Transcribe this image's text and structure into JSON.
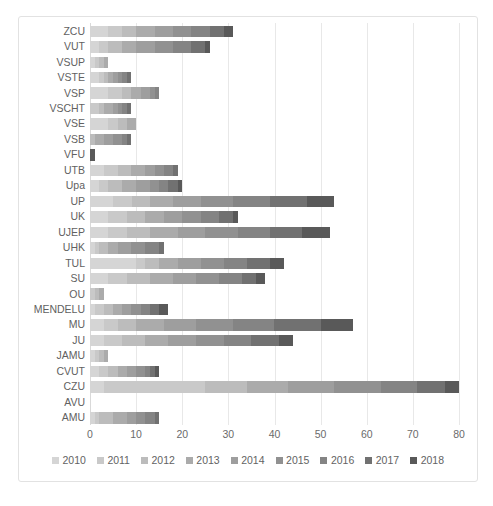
{
  "caption": "",
  "axis": {
    "xticks": [
      0,
      10,
      20,
      30,
      40,
      50,
      60,
      70,
      80
    ],
    "xmin": 0,
    "xmax": 80
  },
  "chart_data": {
    "type": "bar",
    "orientation": "horizontal",
    "stacked": true,
    "title": "",
    "xlabel": "",
    "ylabel": "",
    "xlim": [
      0,
      80
    ],
    "grid": true,
    "legend_position": "bottom",
    "categories": [
      "ZCU",
      "VUT",
      "VSUP",
      "VSTE",
      "VSP",
      "VSCHT",
      "VSE",
      "VSB",
      "VFU",
      "UTB",
      "Upa",
      "UP",
      "UK",
      "UJEP",
      "UHK",
      "TUL",
      "SU",
      "OU",
      "MENDELU",
      "MU",
      "JU",
      "JAMU",
      "CVUT",
      "CZU",
      "AVU",
      "AMU"
    ],
    "series": [
      {
        "name": "2010",
        "color": "#d5d5d5",
        "values": [
          4,
          2,
          1,
          2,
          4,
          0,
          4,
          0,
          0,
          3,
          2,
          5,
          4,
          4,
          1,
          10,
          4,
          0,
          1,
          3,
          3,
          1,
          2,
          3,
          0,
          1
        ]
      },
      {
        "name": "2011",
        "color": "#c9c9c9",
        "values": [
          3,
          2,
          1,
          1,
          3,
          2,
          2,
          0,
          0,
          3,
          2,
          4,
          4,
          4,
          1,
          2,
          4,
          1,
          2,
          3,
          4,
          1,
          2,
          22,
          0,
          1
        ]
      },
      {
        "name": "2012",
        "color": "#bcbcbc",
        "values": [
          3,
          3,
          1,
          1,
          2,
          1,
          2,
          1,
          0,
          3,
          3,
          4,
          4,
          5,
          2,
          3,
          5,
          1,
          2,
          4,
          5,
          1,
          2,
          9,
          0,
          3
        ]
      },
      {
        "name": "2013",
        "color": "#ababab",
        "values": [
          4,
          3,
          1,
          1,
          2,
          2,
          2,
          2,
          0,
          3,
          3,
          5,
          4,
          6,
          2,
          4,
          5,
          1,
          2,
          6,
          5,
          1,
          2,
          9,
          0,
          3
        ]
      },
      {
        "name": "2014",
        "color": "#9e9e9e",
        "values": [
          4,
          4,
          0,
          1,
          2,
          1,
          0,
          2,
          0,
          2,
          3,
          6,
          4,
          6,
          3,
          5,
          5,
          0,
          2,
          7,
          6,
          0,
          2,
          10,
          0,
          2
        ]
      },
      {
        "name": "2015",
        "color": "#919191",
        "values": [
          4,
          4,
          0,
          1,
          1,
          1,
          0,
          2,
          0,
          2,
          2,
          7,
          4,
          7,
          3,
          5,
          5,
          0,
          2,
          8,
          6,
          0,
          2,
          10,
          0,
          2
        ]
      },
      {
        "name": "2016",
        "color": "#848484",
        "values": [
          4,
          4,
          0,
          1,
          1,
          1,
          0,
          1,
          0,
          2,
          2,
          8,
          4,
          7,
          3,
          5,
          5,
          0,
          2,
          9,
          6,
          0,
          1,
          8,
          0,
          2
        ]
      },
      {
        "name": "2017",
        "color": "#717171",
        "values": [
          3,
          3,
          0,
          1,
          0,
          1,
          0,
          1,
          0,
          1,
          2,
          8,
          3,
          7,
          1,
          5,
          3,
          0,
          2,
          10,
          6,
          0,
          1,
          6,
          0,
          1
        ]
      },
      {
        "name": "2018",
        "color": "#595959",
        "values": [
          2,
          1,
          0,
          0,
          0,
          0,
          0,
          0,
          1,
          0,
          1,
          6,
          1,
          6,
          0,
          3,
          2,
          0,
          2,
          7,
          3,
          0,
          1,
          3,
          0,
          0
        ]
      }
    ],
    "totals": [
      31,
      26,
      4,
      9,
      15,
      9,
      10,
      9,
      1,
      19,
      20,
      53,
      32,
      52,
      16,
      42,
      38,
      3,
      17,
      57,
      44,
      4,
      15,
      80,
      0,
      15
    ]
  }
}
